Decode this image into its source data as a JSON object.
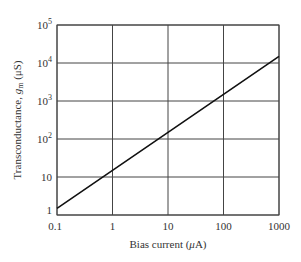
{
  "chart_data": {
    "type": "line",
    "title": "",
    "xlabel": "Bias current (μA)",
    "ylabel": "Transconductance, g_m (μS)",
    "xscale": "log",
    "yscale": "log",
    "xlim": [
      0.1,
      1000
    ],
    "ylim": [
      1,
      100000
    ],
    "x_ticks": [
      "0.1",
      "1",
      "10",
      "100",
      "1000"
    ],
    "y_ticks": [
      "1",
      "10",
      "10^2",
      "10^3",
      "10^4",
      "10^5"
    ],
    "grid": true,
    "series": [
      {
        "name": "g_m vs bias current",
        "x": [
          0.1,
          1,
          10,
          100,
          1000
        ],
        "y": [
          1.5,
          15,
          150,
          1500,
          15000
        ]
      }
    ]
  },
  "axes": {
    "xlabel_prefix": "Bias current (",
    "xlabel_mu": "μ",
    "xlabel_suffix": "A)",
    "ylabel_prefix": "Transconductance, ",
    "ylabel_g": "g",
    "ylabel_sub": "m",
    "ylabel_suffix": " (μS)"
  }
}
